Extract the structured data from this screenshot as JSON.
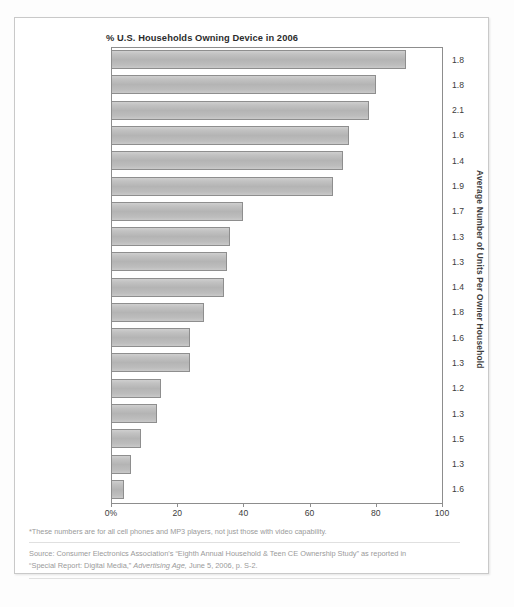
{
  "chart_data": {
    "type": "bar",
    "orientation": "horizontal",
    "title": "% U.S. Households Owning Device in 2006",
    "xlabel": "",
    "ylabel": "",
    "xlim": [
      0,
      100
    ],
    "grid": false,
    "legend": null,
    "xticks": [
      "0%",
      "20",
      "40",
      "60",
      "80",
      "100"
    ],
    "xtick_values": [
      0,
      20,
      40,
      60,
      80,
      100
    ],
    "categories": [
      "VCR",
      "Home DVD player",
      "Cellular phone*",
      "Color TV with screen\n27 inches or bigger",
      "Desktop computer",
      "Color TV with screen\nsmaller than 27 inches",
      "Video game console",
      "DVD recorder",
      "Portable DVD player",
      "Notebook or laptop\ncomputer",
      "Portable game device",
      "Portable MP3 player\nsuch as IPod*",
      "High-definition TV",
      "Digital video recorder\nsuch as TiVo",
      "LCD flat-panel TV",
      "Rear-projection TV",
      "Plasma flat-panel TV",
      "Any other type of TV"
    ],
    "values": [
      89,
      80,
      78,
      72,
      70,
      67,
      40,
      36,
      35,
      34,
      28,
      24,
      24,
      15,
      14,
      9,
      6,
      4
    ],
    "secondary_axis": {
      "title": "Average Number of Units Per Owner Household",
      "values": [
        "1.8",
        "1.8",
        "2.1",
        "1.6",
        "1.4",
        "1.9",
        "1.7",
        "1.3",
        "1.3",
        "1.4",
        "1.8",
        "1.6",
        "1.3",
        "1.2",
        "1.3",
        "1.5",
        "1.3",
        "1.6"
      ]
    },
    "bar_color": "#b8b8b8",
    "bar_border_color": "#8e8e8e"
  },
  "footnote": "*These numbers are for all cell phones and MP3 players, not just those with video capability.",
  "source": {
    "line1_a": "Source: Consumer Electronics Association's “Eighth Annual Household & Teen CE Ownership Study” as reported in",
    "line2_a": "“Special Report: Digital Media,” ",
    "line2_italic": "Advertising Age,",
    "line2_b": " June 5, 2006, p. S-2."
  }
}
